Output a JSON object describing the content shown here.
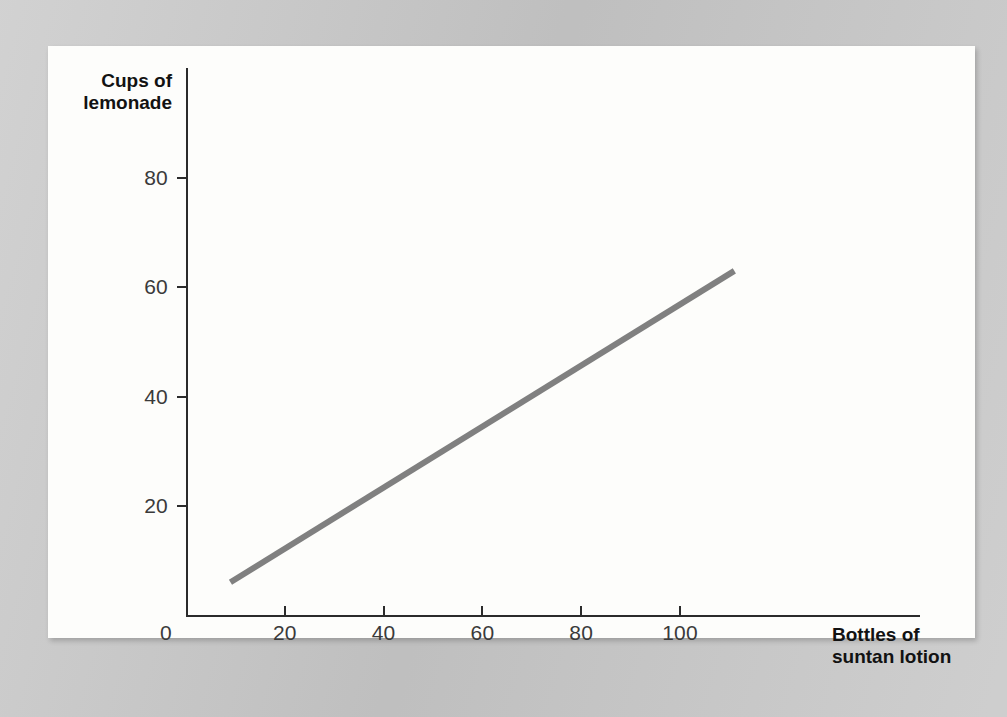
{
  "figure": {
    "paper_color": "#fdfdfb",
    "surround_color": "#c9c9c9",
    "axis_color": "#2b2b2b",
    "series_color": "#808080"
  },
  "chart_data": {
    "type": "line",
    "title": "",
    "subtitle": "",
    "xlabel": "Bottles of suntan lotion",
    "xlabel_lines": [
      "Bottles of",
      "suntan lotion"
    ],
    "ylabel": "Cups of lemonade",
    "ylabel_lines": [
      "Cups of",
      "lemonade"
    ],
    "xlim": [
      0,
      120
    ],
    "ylim": [
      0,
      92
    ],
    "xticks": [
      0,
      20,
      40,
      60,
      80,
      100
    ],
    "xtick_labels": [
      "0",
      "20",
      "40",
      "60",
      "80",
      "100"
    ],
    "yticks": [
      0,
      20,
      40,
      60,
      80
    ],
    "ytick_labels": [
      "0",
      "20",
      "40",
      "60",
      "80"
    ],
    "grid": false,
    "legend": false,
    "legend_position": "none",
    "series": [
      {
        "name": "lemonade vs suntan lotion",
        "color": "#808080",
        "line_width": 6,
        "x": [
          9,
          111
        ],
        "y": [
          6,
          63
        ],
        "points": [
          [
            9,
            6
          ],
          [
            111,
            63
          ]
        ],
        "slope": 0.56,
        "intercept": 1.0,
        "relationship": "positive linear"
      }
    ]
  }
}
